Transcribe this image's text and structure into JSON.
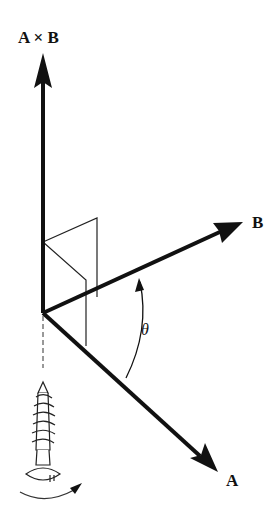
{
  "diagram": {
    "labels": {
      "cross": "A × B",
      "b": "B",
      "a": "A",
      "angle": "θ"
    },
    "vectors": [
      {
        "name": "A×B",
        "from": [
          43,
          313
        ],
        "to": [
          43,
          53
        ]
      },
      {
        "name": "B",
        "from": [
          43,
          313
        ],
        "to": [
          243,
          222
        ]
      },
      {
        "name": "A",
        "from": [
          43,
          313
        ],
        "to": [
          218,
          472
        ]
      }
    ],
    "colors": {
      "stroke": "#111111",
      "background": "#ffffff"
    }
  }
}
